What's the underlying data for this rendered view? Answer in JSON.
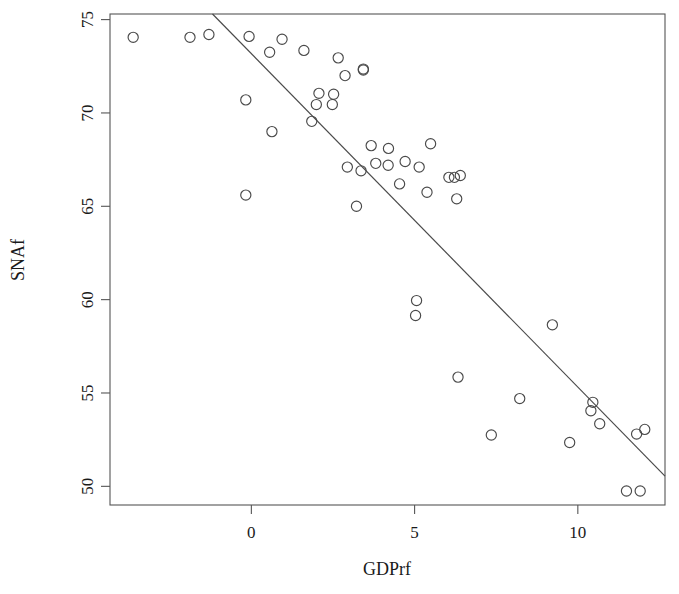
{
  "chart_data": {
    "type": "scatter",
    "title": "",
    "xlabel": "GDPrf",
    "ylabel": "SNAf",
    "xlim": [
      -4.33,
      12.67
    ],
    "ylim": [
      49.0,
      75.3
    ],
    "xticks": [
      0,
      5,
      10
    ],
    "xtick_labels": [
      "0",
      "5",
      "10"
    ],
    "yticks": [
      50,
      55,
      60,
      65,
      70,
      75
    ],
    "ytick_labels": [
      "50",
      "55",
      "60",
      "65",
      "70",
      "75"
    ],
    "grid": false,
    "legend": false,
    "marker": "open-circle",
    "marker_color": "#4a4a4a",
    "frame_color": "#555555",
    "points": [
      {
        "x": -3.62,
        "y": 74.05
      },
      {
        "x": -1.88,
        "y": 74.05
      },
      {
        "x": -1.3,
        "y": 74.2
      },
      {
        "x": -0.07,
        "y": 74.1
      },
      {
        "x": 0.94,
        "y": 73.95
      },
      {
        "x": 0.56,
        "y": 73.25
      },
      {
        "x": 1.61,
        "y": 73.35
      },
      {
        "x": 2.66,
        "y": 72.95
      },
      {
        "x": 3.43,
        "y": 72.35
      },
      {
        "x": 3.43,
        "y": 72.3
      },
      {
        "x": 2.87,
        "y": 72.0
      },
      {
        "x": -0.17,
        "y": 70.7
      },
      {
        "x": 2.07,
        "y": 71.05
      },
      {
        "x": 2.52,
        "y": 71.0
      },
      {
        "x": 1.99,
        "y": 70.45
      },
      {
        "x": 2.48,
        "y": 70.45
      },
      {
        "x": 1.85,
        "y": 69.55
      },
      {
        "x": 0.63,
        "y": 69.0
      },
      {
        "x": 2.94,
        "y": 67.1
      },
      {
        "x": 3.36,
        "y": 66.9
      },
      {
        "x": 3.67,
        "y": 68.25
      },
      {
        "x": 4.2,
        "y": 68.1
      },
      {
        "x": 5.49,
        "y": 68.35
      },
      {
        "x": 4.71,
        "y": 67.4
      },
      {
        "x": 3.81,
        "y": 67.3
      },
      {
        "x": 4.19,
        "y": 67.2
      },
      {
        "x": 5.14,
        "y": 67.1
      },
      {
        "x": 4.54,
        "y": 66.2
      },
      {
        "x": 5.38,
        "y": 65.75
      },
      {
        "x": 6.05,
        "y": 66.55
      },
      {
        "x": 6.22,
        "y": 66.55
      },
      {
        "x": 6.4,
        "y": 66.65
      },
      {
        "x": 6.29,
        "y": 65.4
      },
      {
        "x": -0.17,
        "y": 65.6
      },
      {
        "x": 3.22,
        "y": 65.0
      },
      {
        "x": 5.06,
        "y": 59.95
      },
      {
        "x": 5.03,
        "y": 59.15
      },
      {
        "x": 6.33,
        "y": 55.85
      },
      {
        "x": 8.22,
        "y": 54.7
      },
      {
        "x": 9.22,
        "y": 58.65
      },
      {
        "x": 10.4,
        "y": 54.05
      },
      {
        "x": 10.67,
        "y": 53.35
      },
      {
        "x": 11.8,
        "y": 52.8
      },
      {
        "x": 12.05,
        "y": 53.05
      },
      {
        "x": 10.46,
        "y": 54.5
      },
      {
        "x": 7.35,
        "y": 52.75
      },
      {
        "x": 9.75,
        "y": 52.35
      },
      {
        "x": 11.49,
        "y": 49.75
      },
      {
        "x": 11.91,
        "y": 49.75
      }
    ],
    "regression_line": {
      "x1": -1.19,
      "y1": 75.3,
      "x2": 12.67,
      "y2": 50.55
    }
  }
}
